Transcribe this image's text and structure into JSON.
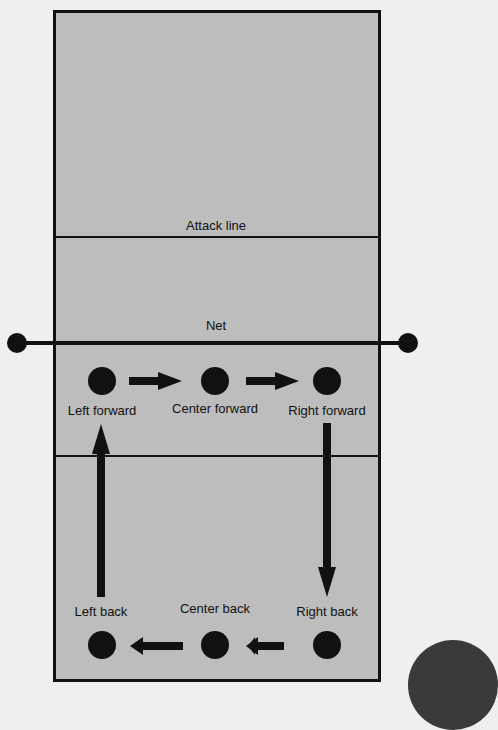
{
  "lines": {
    "attack_line": "Attack line",
    "net": "Net"
  },
  "positions": [
    {
      "id": "left-forward",
      "label": "Left forward"
    },
    {
      "id": "center-forward",
      "label": "Center forward"
    },
    {
      "id": "right-forward",
      "label": "Right forward"
    },
    {
      "id": "left-back",
      "label": "Left back"
    },
    {
      "id": "center-back",
      "label": "Center back"
    },
    {
      "id": "right-back",
      "label": "Right back"
    }
  ],
  "rotation_order": [
    "Right back",
    "Right forward",
    "Center forward",
    "Left forward",
    "Left back",
    "Center back"
  ],
  "colors": {
    "court": "#bdbdbd",
    "lines": "#111111",
    "background": "#efefef"
  }
}
